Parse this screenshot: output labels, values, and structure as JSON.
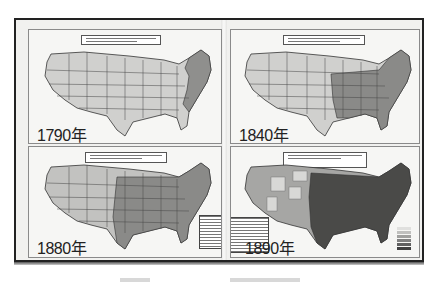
{
  "document": {
    "type": "scanned book spread",
    "subject": "US population density maps"
  },
  "maps": [
    {
      "year_label": "1790年",
      "position": "top-left"
    },
    {
      "year_label": "1840年",
      "position": "top-right"
    },
    {
      "year_label": "1880年",
      "position": "bottom-left"
    },
    {
      "year_label": "1890年",
      "position": "bottom-right"
    }
  ],
  "colors": {
    "unsettled": "#d4d4d2",
    "light": "#b8b8b6",
    "medium": "#8f8f8d",
    "dense": "#5a5a58",
    "very_dense": "#3a3a38",
    "border": "#222222"
  }
}
